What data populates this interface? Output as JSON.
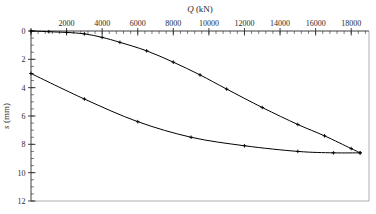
{
  "chart_data": {
    "type": "line",
    "title": "",
    "xlabel": "Q (kN)",
    "ylabel": "s (mm)",
    "xlim": [
      0,
      19000
    ],
    "ylim": [
      0,
      12
    ],
    "y_inverted": true,
    "grid": false,
    "legend": "none",
    "xticks": [
      0,
      2000,
      4000,
      6000,
      8000,
      10000,
      12000,
      14000,
      16000,
      18000
    ],
    "xtick_labels": [
      "",
      "2000",
      "4000",
      "6000",
      "8000",
      "10000",
      "12000",
      "14000",
      "16000",
      "18000"
    ],
    "x_minor_tick_interval": 400,
    "yticks": [
      0,
      2,
      4,
      6,
      8,
      10,
      12
    ],
    "ytick_labels": [
      "0",
      "2",
      "4",
      "6",
      "8",
      "10",
      "12"
    ],
    "y_minor_tick_interval": 0.5,
    "x_axis_position": "top",
    "y_axis_position": "left",
    "series": [
      {
        "name": "upper-branch",
        "marker": "plus",
        "color": "#000000",
        "points": [
          {
            "x": 0,
            "y": 0.0
          },
          {
            "x": 1000,
            "y": 0.05
          },
          {
            "x": 2000,
            "y": 0.1
          },
          {
            "x": 3000,
            "y": 0.2
          },
          {
            "x": 4000,
            "y": 0.45
          },
          {
            "x": 5000,
            "y": 0.8
          },
          {
            "x": 6500,
            "y": 1.4
          },
          {
            "x": 8000,
            "y": 2.2
          },
          {
            "x": 9500,
            "y": 3.1
          },
          {
            "x": 11000,
            "y": 4.1
          },
          {
            "x": 13000,
            "y": 5.4
          },
          {
            "x": 15000,
            "y": 6.6
          },
          {
            "x": 16500,
            "y": 7.4
          },
          {
            "x": 18000,
            "y": 8.3
          },
          {
            "x": 18500,
            "y": 8.6
          }
        ]
      },
      {
        "name": "lower-branch",
        "marker": "plus",
        "color": "#000000",
        "points": [
          {
            "x": 0,
            "y": 3.0
          },
          {
            "x": 3000,
            "y": 4.8
          },
          {
            "x": 6000,
            "y": 6.4
          },
          {
            "x": 9000,
            "y": 7.5
          },
          {
            "x": 12000,
            "y": 8.1
          },
          {
            "x": 15000,
            "y": 8.5
          },
          {
            "x": 17000,
            "y": 8.6
          },
          {
            "x": 18500,
            "y": 8.6
          }
        ]
      }
    ]
  },
  "figure": {
    "background_color": "#ffffff",
    "axis_color": "#2b2b2b",
    "curve_color": "#000000"
  }
}
